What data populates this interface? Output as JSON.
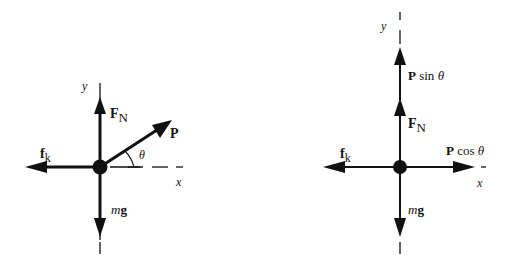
{
  "diagram_left": {
    "title": "Free-body diagram with applied force P at angle theta",
    "axis_y_label": "y",
    "axis_x_label": "x",
    "forces": {
      "normal": {
        "main": "F",
        "sub": "N"
      },
      "friction": {
        "main": "f",
        "sub": "k"
      },
      "applied": "P",
      "weight": {
        "m": "m",
        "g": "g"
      }
    },
    "angle_label": "θ"
  },
  "diagram_right": {
    "title": "Free-body diagram with P resolved into components",
    "axis_y_label": "y",
    "axis_x_label": "x",
    "forces": {
      "p_sin": {
        "P": "P",
        "text": " sin ",
        "theta": "θ"
      },
      "normal": {
        "main": "F",
        "sub": "N"
      },
      "friction": {
        "main": "f",
        "sub": "k"
      },
      "p_cos": {
        "P": "P",
        "text": " cos ",
        "theta": "θ"
      },
      "weight": {
        "m": "m",
        "g": "g"
      }
    }
  },
  "colors": {
    "ink": "#111111",
    "background": "#ffffff"
  }
}
